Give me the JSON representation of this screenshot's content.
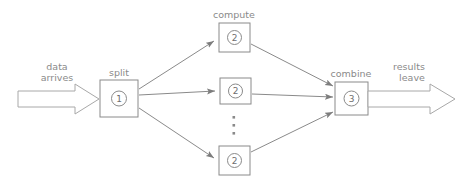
{
  "diagram": {
    "colors": {
      "stroke": "#8a8a8a",
      "arrow_stroke": "#a8a8a8",
      "text": "#8a8a8a",
      "background": "#ffffff"
    },
    "input_flow": {
      "label_line1": "data",
      "label_line2": "arrives",
      "icon": "block-arrow-right-icon"
    },
    "output_flow": {
      "label_line1": "results",
      "label_line2": "leave",
      "icon": "block-arrow-right-icon"
    },
    "stages": {
      "split": {
        "label": "split",
        "number": "1"
      },
      "compute": {
        "label": "compute",
        "number": "2",
        "instances": [
          "2",
          "2",
          "2"
        ],
        "ellipsis": "vertical-ellipsis-icon",
        "ellipsis_text": "⋮"
      },
      "combine": {
        "label": "combine",
        "number": "3"
      }
    },
    "connectors": [
      {
        "from": "split",
        "to": "compute-top",
        "icon": "arrow-icon"
      },
      {
        "from": "split",
        "to": "compute-middle",
        "icon": "arrow-icon"
      },
      {
        "from": "split",
        "to": "compute-bottom",
        "icon": "arrow-icon"
      },
      {
        "from": "compute-top",
        "to": "combine",
        "icon": "arrow-icon"
      },
      {
        "from": "compute-middle",
        "to": "combine",
        "icon": "arrow-icon"
      },
      {
        "from": "compute-bottom",
        "to": "combine",
        "icon": "arrow-icon"
      }
    ]
  }
}
